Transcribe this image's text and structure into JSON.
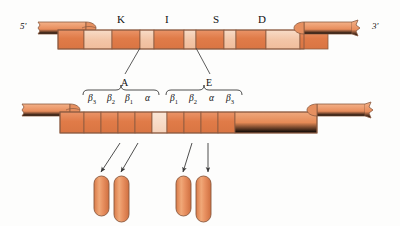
{
  "figure": {
    "type": "biological-schematic"
  },
  "colors": {
    "segment_dark": "#e08050",
    "segment_mid": "#e49468",
    "segment_light": "#f2c3a6",
    "segment_pale": "#f6d6c0",
    "outline": "#6b4a3a",
    "line": "#4a4a4a",
    "background": "#fdfdfc"
  },
  "strand_top": {
    "name": "upper-dna-strand",
    "end_labels": {
      "left": "5'",
      "right": "3'"
    },
    "gene_labels": [
      {
        "text": "K",
        "x": 117
      },
      {
        "text": "I",
        "x": 165
      },
      {
        "text": "S",
        "x": 213
      },
      {
        "text": "D",
        "x": 258
      }
    ],
    "segments": [
      {
        "shade": "dark",
        "w": 26
      },
      {
        "shade": "light",
        "w": 28
      },
      {
        "shade": "dark",
        "w": 28
      },
      {
        "shade": "light",
        "w": 14
      },
      {
        "shade": "dark",
        "w": 30
      },
      {
        "shade": "light",
        "w": 12
      },
      {
        "shade": "dark",
        "w": 28
      },
      {
        "shade": "light",
        "w": 12
      },
      {
        "shade": "dark",
        "w": 30
      },
      {
        "shade": "light",
        "w": 34
      },
      {
        "shade": "dark",
        "w": 28
      }
    ]
  },
  "strand_bottom": {
    "name": "lower-dna-strand",
    "segments": [
      {
        "shade": "dark",
        "w": 24
      },
      {
        "shade": "dark",
        "w": 17
      },
      {
        "shade": "dark",
        "w": 17
      },
      {
        "shade": "dark",
        "w": 17
      },
      {
        "shade": "dark",
        "w": 17
      },
      {
        "shade": "pale",
        "w": 15
      },
      {
        "shade": "dark",
        "w": 17
      },
      {
        "shade": "dark",
        "w": 17
      },
      {
        "shade": "dark",
        "w": 17
      },
      {
        "shade": "dark",
        "w": 17
      },
      {
        "shade": "mid",
        "w": 82
      }
    ]
  },
  "brace_groups": [
    {
      "name": "group-a",
      "letter": "A",
      "leader_from_x": 140,
      "leader_from_y": 48,
      "letter_x": 121,
      "letter_y": 78,
      "brace_x": 83,
      "brace_w": 76,
      "brace_y": 90,
      "chain_labels": [
        {
          "base": "β",
          "sub": "3",
          "x": 88
        },
        {
          "base": "β",
          "sub": "2",
          "x": 107
        },
        {
          "base": "β",
          "sub": "1",
          "x": 125
        },
        {
          "base": "α",
          "sub": "",
          "x": 145
        }
      ]
    },
    {
      "name": "group-e",
      "letter": "E",
      "leader_from_x": 196,
      "leader_from_y": 48,
      "letter_x": 206,
      "letter_y": 78,
      "brace_x": 166,
      "brace_w": 76,
      "brace_y": 90,
      "chain_labels": [
        {
          "base": "β",
          "sub": "1",
          "x": 170
        },
        {
          "base": "β",
          "sub": "2",
          "x": 189
        },
        {
          "base": "α",
          "sub": "",
          "x": 209
        },
        {
          "base": "β",
          "sub": "3",
          "x": 226
        }
      ]
    }
  ],
  "arrows": [
    {
      "name": "arrow-1",
      "x1": 120,
      "y1": 143,
      "x2": 101,
      "y2": 172
    },
    {
      "name": "arrow-2",
      "x1": 138,
      "y1": 143,
      "x2": 121,
      "y2": 172
    },
    {
      "name": "arrow-3",
      "x1": 192,
      "y1": 143,
      "x2": 183,
      "y2": 172
    },
    {
      "name": "arrow-4",
      "x1": 208,
      "y1": 143,
      "x2": 208,
      "y2": 172
    }
  ],
  "capsules": [
    {
      "name": "capsule-1",
      "x": 94,
      "y": 176,
      "w": 15,
      "h": 40
    },
    {
      "name": "capsule-2",
      "x": 114,
      "y": 176,
      "w": 15,
      "h": 46
    },
    {
      "name": "capsule-3",
      "x": 176,
      "y": 176,
      "w": 15,
      "h": 40
    },
    {
      "name": "capsule-4",
      "x": 196,
      "y": 176,
      "w": 15,
      "h": 46
    }
  ]
}
